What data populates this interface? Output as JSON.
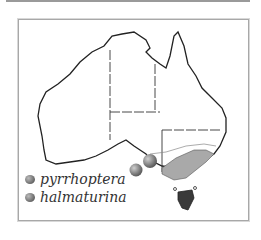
{
  "map": {
    "title": "Australia distribution map",
    "colors": {
      "outline": "#222222",
      "range_fill": "#a9a9a9",
      "range_dark": "#3a3a3a",
      "border": "#a8a8a8"
    }
  },
  "legend": {
    "items": [
      {
        "label": "pyrrhoptera",
        "icon": "gray-sphere-icon"
      },
      {
        "label": "halmaturina",
        "icon": "gray-sphere-icon"
      }
    ]
  }
}
